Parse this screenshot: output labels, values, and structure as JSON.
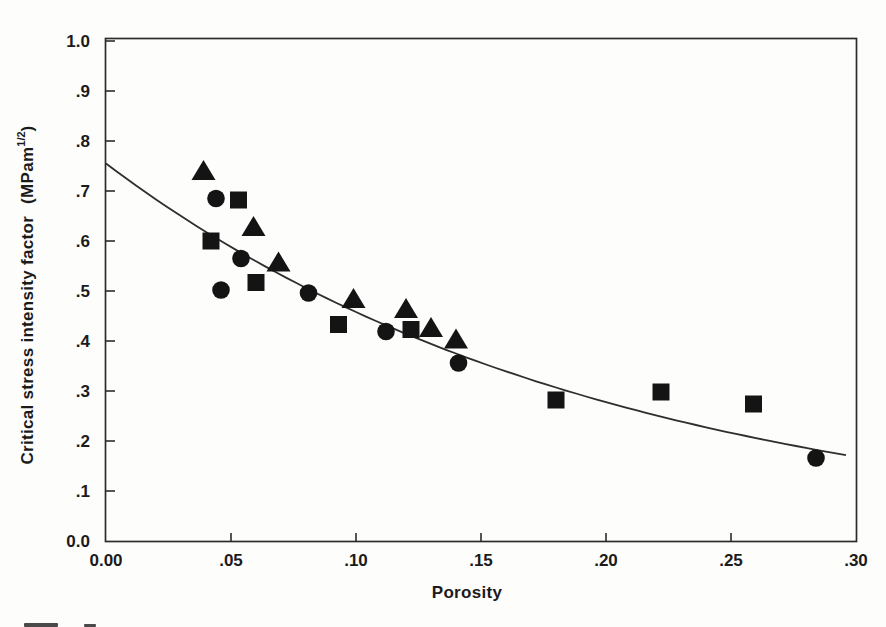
{
  "figure": {
    "xlabel": "Porosity",
    "ylabel_main": "Critical stress intensity factor",
    "ylabel_units_open": "(MPam",
    "ylabel_sup": "1/2",
    "ylabel_close": ")"
  },
  "chart_data": {
    "type": "scatter",
    "title": "",
    "xlabel": "Porosity",
    "ylabel": "Critical stress intensity factor (MPam 1/2)",
    "xlim": [
      0.0,
      0.3
    ],
    "ylim": [
      0.0,
      1.0
    ],
    "grid": false,
    "legend": "none",
    "marker_color": "#141414",
    "axis_color": "#2b2b2b",
    "x_axis": {
      "tick_label_values": [
        0.0,
        0.05,
        0.1,
        0.15,
        0.2,
        0.25,
        0.3
      ],
      "tick_labels": [
        "0.00",
        ".05",
        ".10",
        ".15",
        ".20",
        ".25",
        ".30"
      ],
      "tick_mark_values": [
        0.05,
        0.1,
        0.15,
        0.2,
        0.25
      ]
    },
    "y_axis": {
      "tick_label_values": [
        0.0,
        0.1,
        0.2,
        0.3,
        0.4,
        0.5,
        0.6,
        0.7,
        0.8,
        0.9,
        1.0
      ],
      "tick_labels": [
        "0.0",
        ".1",
        ".2",
        ".3",
        ".4",
        ".5",
        ".6",
        ".7",
        ".8",
        ".9",
        "1.0"
      ],
      "tick_mark_values": [
        0.1,
        0.2,
        0.3,
        0.4,
        0.5,
        0.6,
        0.7,
        0.8,
        0.9,
        1.0
      ]
    },
    "series": [
      {
        "name": "triangle-markers",
        "marker": "triangle",
        "points": [
          [
            0.039,
            0.74
          ],
          [
            0.059,
            0.628
          ],
          [
            0.069,
            0.557
          ],
          [
            0.099,
            0.484
          ],
          [
            0.12,
            0.464
          ],
          [
            0.13,
            0.426
          ],
          [
            0.14,
            0.403
          ]
        ]
      },
      {
        "name": "circle-markers",
        "marker": "circle",
        "points": [
          [
            0.044,
            0.685
          ],
          [
            0.046,
            0.502
          ],
          [
            0.054,
            0.565
          ],
          [
            0.081,
            0.496
          ],
          [
            0.112,
            0.419
          ],
          [
            0.141,
            0.356
          ],
          [
            0.284,
            0.166
          ]
        ]
      },
      {
        "name": "square-markers",
        "marker": "square",
        "points": [
          [
            0.042,
            0.6
          ],
          [
            0.053,
            0.682
          ],
          [
            0.06,
            0.517
          ],
          [
            0.093,
            0.433
          ],
          [
            0.122,
            0.423
          ],
          [
            0.18,
            0.282
          ],
          [
            0.222,
            0.298
          ],
          [
            0.259,
            0.274
          ]
        ]
      }
    ],
    "fit_curve": {
      "type": "exponential",
      "formula": "K = 0.755 * exp(-5.0 * P)",
      "a": 0.755,
      "b": 5.0,
      "x_start": 0.0,
      "x_end": 0.298
    }
  }
}
